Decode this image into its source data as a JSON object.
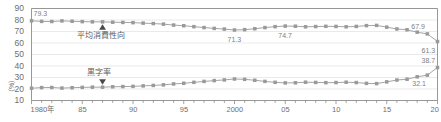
{
  "chart_data": {
    "type": "line",
    "title": "",
    "xlabel": "",
    "ylabel": "(%)",
    "ylim": [
      10,
      90
    ],
    "xlim": [
      1980,
      2020
    ],
    "grid": true,
    "legend_position": "inline-annotations",
    "yticks": [
      "90",
      "80",
      "70",
      "60",
      "50",
      "40",
      "30",
      "20",
      "10"
    ],
    "xticks": [
      "1980年",
      "85",
      "90",
      "95",
      "2000",
      "05",
      "10",
      "15",
      "20"
    ],
    "xtick_years": [
      1980,
      1985,
      1990,
      1995,
      2000,
      2005,
      2010,
      2015,
      2020
    ],
    "x": [
      1980,
      1981,
      1982,
      1983,
      1984,
      1985,
      1986,
      1987,
      1988,
      1989,
      1990,
      1991,
      1992,
      1993,
      1994,
      1995,
      1996,
      1997,
      1998,
      1999,
      2000,
      2001,
      2002,
      2003,
      2004,
      2005,
      2006,
      2007,
      2008,
      2009,
      2010,
      2011,
      2012,
      2013,
      2014,
      2015,
      2016,
      2017,
      2018,
      2019,
      2020
    ],
    "series": [
      {
        "name": "平均消費性向",
        "color": "#9a9a9a",
        "marker": "square",
        "values": [
          79.3,
          78.8,
          78.7,
          79.2,
          78.9,
          78.6,
          78.4,
          78.4,
          78.1,
          77.9,
          77.7,
          77.3,
          76.9,
          76.4,
          75.6,
          75.0,
          74.2,
          73.4,
          72.7,
          72.1,
          71.3,
          71.6,
          72.4,
          73.4,
          74.2,
          74.7,
          74.6,
          74.1,
          74.3,
          74.5,
          74.4,
          74.1,
          74.4,
          75.1,
          75.3,
          73.8,
          72.2,
          71.5,
          69.4,
          67.9,
          61.3
        ],
        "labeled_points": [
          {
            "year": 1980,
            "value": 79.3,
            "label": "79.3"
          },
          {
            "year": 2000,
            "value": 71.3,
            "label": "71.3"
          },
          {
            "year": 2005,
            "value": 74.7,
            "label": "74.7"
          },
          {
            "year": 2019,
            "value": 67.9,
            "label": "67.9"
          },
          {
            "year": 2020,
            "value": 61.3,
            "label": "61.3"
          }
        ]
      },
      {
        "name": "黒字率",
        "color": "#9a9a9a",
        "marker": "square",
        "values": [
          20.7,
          21.2,
          21.3,
          20.8,
          21.1,
          21.4,
          21.6,
          21.6,
          21.9,
          22.1,
          22.3,
          22.7,
          23.1,
          23.6,
          24.4,
          25.0,
          25.8,
          26.6,
          27.3,
          27.9,
          28.7,
          28.4,
          27.6,
          26.6,
          25.8,
          25.3,
          25.4,
          25.9,
          25.7,
          25.5,
          25.6,
          25.9,
          25.6,
          24.9,
          24.7,
          26.2,
          27.8,
          28.5,
          30.6,
          32.1,
          38.7
        ],
        "labeled_points": [
          {
            "year": 2019,
            "value": 32.1,
            "label": "32.1"
          },
          {
            "year": 2020,
            "value": 38.7,
            "label": "38.7"
          }
        ]
      }
    ],
    "annotations": [
      {
        "name": "average-propensity-to-consume",
        "text": "平均消費性向",
        "marker": "up-triangle"
      },
      {
        "name": "surplus-rate",
        "text": "黒字率",
        "marker": "down-triangle"
      }
    ]
  },
  "axis": {
    "y_unit": "（%）"
  }
}
